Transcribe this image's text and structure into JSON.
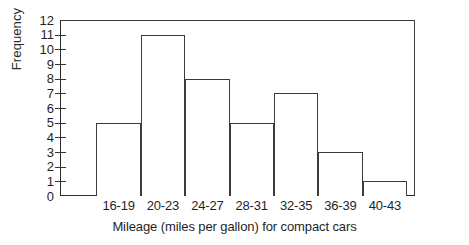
{
  "chart_data": {
    "type": "bar",
    "title": "",
    "subtitle": "",
    "xlabel": "Mileage (miles per gallon) for compact cars",
    "ylabel": "Frequency",
    "categories": [
      "16-19",
      "20-23",
      "24-27",
      "28-31",
      "32-35",
      "36-39",
      "40-43"
    ],
    "values": [
      5,
      11,
      8,
      5,
      7,
      3,
      1
    ],
    "series": [
      {
        "name": "Frequency",
        "values": [
          5,
          11,
          8,
          5,
          7,
          3,
          1
        ]
      }
    ],
    "ylim": [
      0,
      12
    ],
    "y_ticks": [
      0,
      1,
      2,
      3,
      4,
      5,
      6,
      7,
      8,
      9,
      10,
      11,
      12
    ],
    "y_tick_labels": [
      "0",
      "1",
      "2",
      "3",
      "4",
      "5",
      "6",
      "7",
      "8",
      "9",
      "10",
      "11",
      "12"
    ],
    "grid": false,
    "legend": false,
    "legend_position": "none",
    "bar_fill": "#ffffff",
    "bar_edge_color": "#3b3b3b",
    "axis_color": "#2b2b2b",
    "background": "#ffffff",
    "annotations": []
  }
}
